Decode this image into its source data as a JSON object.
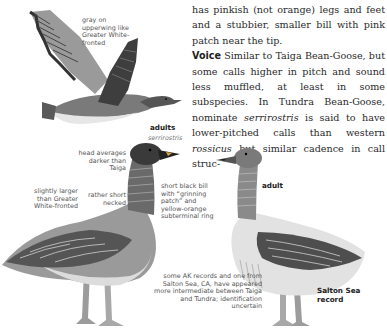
{
  "body_text": {
    "line1": "has pinkish (not orange) legs and feet and a stubbier, smaller bill with pink patch near the tip.",
    "voice_heading": "Voice",
    "voice_part1": " Similar to Taiga Bean-Goose, but some calls higher in pitch and sound less muffled, at least in some subspecies. In Tundra Bean-Goose, nominate ",
    "voice_italic1": "serrirostris",
    "voice_part2": " is said to have lower-pitched calls than western ",
    "voice_italic2": "rossicus",
    "voice_part3": " but similar cadence in call struc-"
  },
  "illustrations": {
    "flying": {
      "label_wing": "gray on upperwing like Greater White-fronted"
    },
    "left_adult": {
      "caption": "adults",
      "subcaption": "serrirostris",
      "label_head": "head averages darker than Taiga",
      "label_size": "slightly larger than Greater White-fronted",
      "label_neck": "rather short necked",
      "label_bill": "short black bill with “grinning patch” and yellow-orange subterminal ring"
    },
    "right_adult": {
      "caption": "adult",
      "label_records": "some AK records and one from Salton Sea, CA, have appeared more intermediate between Taiga and Tundra; identification uncertain",
      "caption_record": "Salton Sea record"
    }
  },
  "colors": {
    "text": "#2a2a2a",
    "label": "#555555",
    "goose_dark": "#4a4a4a",
    "goose_mid": "#8a8a8a",
    "goose_light": "#d6d6d6"
  }
}
